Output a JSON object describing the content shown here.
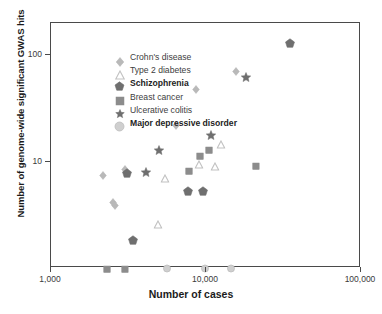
{
  "chart_data": {
    "type": "scatter",
    "title": "",
    "xlabel": "Number of cases",
    "ylabel": "Number of genome-wide significant GWAS hits",
    "xscale": "log",
    "yscale": "log",
    "xlim": [
      1000,
      100000
    ],
    "ylim": [
      1,
      200
    ],
    "xticks": [
      1000,
      10000,
      100000
    ],
    "xtick_labels": [
      "1,000",
      "10,000",
      "100,000"
    ],
    "yticks": [
      10,
      100
    ],
    "ytick_labels": [
      "10",
      "100"
    ],
    "grid": false,
    "legend_position": "top-left",
    "series": [
      {
        "name": "Crohn's disease",
        "marker": "diamond",
        "color": "#b9b9b9",
        "points": [
          {
            "x": 2150,
            "y": 7.5
          },
          {
            "x": 3000,
            "y": 8.5
          },
          {
            "x": 2500,
            "y": 4.2
          },
          {
            "x": 2600,
            "y": 3.9
          },
          {
            "x": 6400,
            "y": 22
          },
          {
            "x": 8600,
            "y": 48
          },
          {
            "x": 15500,
            "y": 71
          }
        ]
      },
      {
        "name": "Type 2 diabetes",
        "marker": "triangle",
        "color": "#c2c2c2",
        "points": [
          {
            "x": 5400,
            "y": 7.0
          },
          {
            "x": 9000,
            "y": 9.5
          },
          {
            "x": 11500,
            "y": 9.0
          },
          {
            "x": 12500,
            "y": 14.5
          },
          {
            "x": 4900,
            "y": 2.6
          }
        ]
      },
      {
        "name": "Schizophrenia",
        "marker": "pentagon",
        "color": "#6f6f6f",
        "points": [
          {
            "x": 3100,
            "y": 7.6
          },
          {
            "x": 3400,
            "y": 1.8
          },
          {
            "x": 7600,
            "y": 5.2
          },
          {
            "x": 9600,
            "y": 5.2
          },
          {
            "x": 35000,
            "y": 128
          }
        ]
      },
      {
        "name": "Breast cancer",
        "marker": "square",
        "color": "#8c8c8c",
        "points": [
          {
            "x": 2300,
            "y": 1.0
          },
          {
            "x": 3000,
            "y": 1.0
          },
          {
            "x": 7800,
            "y": 8.3
          },
          {
            "x": 9200,
            "y": 11.5
          },
          {
            "x": 10500,
            "y": 13.0
          },
          {
            "x": 21000,
            "y": 9.2
          }
        ]
      },
      {
        "name": "Ulcerative colitis",
        "marker": "star",
        "color": "#6f6f6f",
        "points": [
          {
            "x": 4100,
            "y": 7.8
          },
          {
            "x": 5000,
            "y": 12.5
          },
          {
            "x": 10800,
            "y": 17.5
          },
          {
            "x": 18000,
            "y": 61
          }
        ]
      },
      {
        "name": "Major depressive disorder",
        "marker": "circle",
        "color": "#cfcfcf",
        "points": [
          {
            "x": 5600,
            "y": 1.0
          },
          {
            "x": 9800,
            "y": 1.0
          },
          {
            "x": 14500,
            "y": 1.0
          }
        ]
      }
    ]
  },
  "legend": {
    "items": [
      {
        "label": "Crohn's disease",
        "marker": "diamond",
        "color": "#b9b9b9",
        "bold": false
      },
      {
        "label": "Type 2 diabetes",
        "marker": "triangle",
        "color": "#c2c2c2",
        "bold": false
      },
      {
        "label": "Schizophrenia",
        "marker": "pentagon",
        "color": "#6f6f6f",
        "bold": true
      },
      {
        "label": "Breast cancer",
        "marker": "square",
        "color": "#8c8c8c",
        "bold": false
      },
      {
        "label": "Ulcerative colitis",
        "marker": "star",
        "color": "#6f6f6f",
        "bold": false
      },
      {
        "label": "Major depressive disorder",
        "marker": "circle",
        "color": "#cfcfcf",
        "bold": true
      }
    ]
  },
  "axes": {
    "x_title": "Number of cases",
    "y_title": "Number of genome-wide significant GWAS hits"
  },
  "colors": {
    "frame": "#4a4a4a",
    "text": "#2b2b2b",
    "background": "#ffffff"
  }
}
